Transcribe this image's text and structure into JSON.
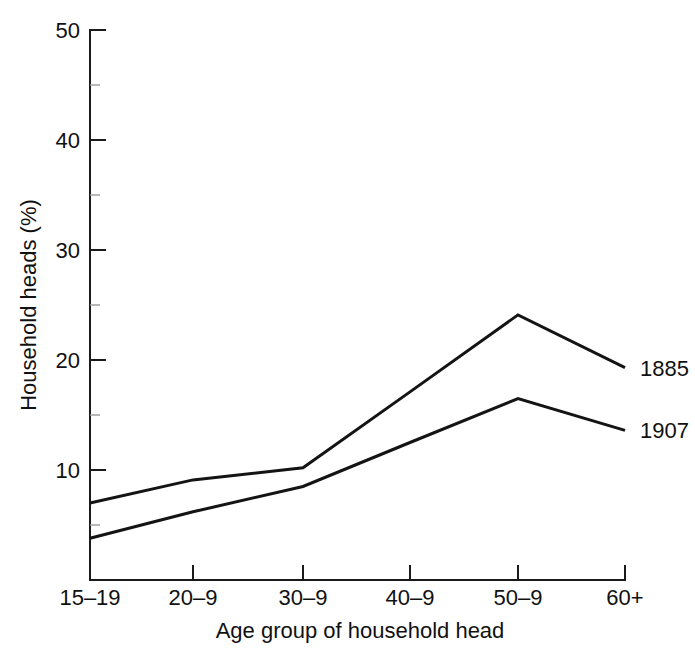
{
  "chart_data": {
    "type": "line",
    "title": "",
    "subtitle": "",
    "xlabel": "Age group of household head",
    "ylabel": "Household heads (%)",
    "categories": [
      "15–19",
      "20–9",
      "30–9",
      "40–9",
      "50–9",
      "60+"
    ],
    "x_tick_labels": [
      "15–19",
      "20–9",
      "30–9",
      "40–9",
      "50–9",
      "60+"
    ],
    "y_tick_labels": [
      "10",
      "20",
      "30",
      "40",
      "50"
    ],
    "y_ticks": [
      10,
      20,
      30,
      40,
      50
    ],
    "y_minor_ticks": [
      5,
      15,
      25,
      35,
      45
    ],
    "ylim": [
      0,
      50
    ],
    "grid": false,
    "legend_position": "right-of-line-ends",
    "series": [
      {
        "name": "1885",
        "label": "1885",
        "color": "#141414",
        "values": [
          7.0,
          9.1,
          10.2,
          17.1,
          24.1,
          19.3
        ]
      },
      {
        "name": "1907",
        "label": "1907",
        "color": "#141414",
        "values": [
          3.8,
          6.2,
          8.5,
          12.5,
          16.5,
          13.6
        ]
      }
    ]
  },
  "axes": {
    "y_title": "Household heads (%)",
    "x_title": "Age group of household head"
  },
  "labels": {
    "y_50": "50",
    "y_40": "40",
    "y_30": "30",
    "y_20": "20",
    "y_10": "10",
    "x_0": "15–19",
    "x_1": "20–9",
    "x_2": "30–9",
    "x_3": "40–9",
    "x_4": "50–9",
    "x_5": "60+",
    "series_upper": "1885",
    "series_lower": "1907"
  },
  "caption": {
    "text": ""
  }
}
